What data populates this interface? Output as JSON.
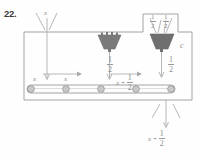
{
  "problem": {
    "number": "22."
  },
  "diagram": {
    "type": "function-machine-conveyor",
    "input_label": "x",
    "machine_side_label": "c",
    "hopper_left_top_fraction": {
      "numerator": "1",
      "denominator": "2"
    },
    "hopper_right_top_fraction": {
      "numerator": "1",
      "denominator": "2"
    },
    "middle_drop_fraction": {
      "numerator": "1",
      "denominator": "2"
    },
    "right_drop_fraction": {
      "numerator": "1",
      "denominator": "2"
    },
    "belt_labels": {
      "first_x": "x",
      "second_x": "x",
      "third_x": "x",
      "plus_sign": "+",
      "sum_fraction": {
        "numerator": "1",
        "denominator": "2"
      }
    },
    "output_label": {
      "variable": "x",
      "plus_sign": "+",
      "fraction": {
        "numerator": "1",
        "denominator": "2"
      }
    },
    "colors": {
      "line": "#9a9a9a",
      "hopper_fill": "#7a7a7a",
      "roller_fill": "#c9c9c9",
      "text": "#8d8d8d",
      "number_text": "#3a3a3a"
    },
    "roller_count": 5
  }
}
